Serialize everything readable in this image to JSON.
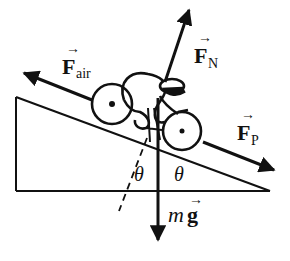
{
  "diagram": {
    "colors": {
      "ink": "#111111",
      "background": "#ffffff"
    },
    "forces": {
      "air": {
        "symbol": "F",
        "subscript": "air",
        "arrow": "→"
      },
      "normal": {
        "symbol": "F",
        "subscript": "N",
        "arrow": "→"
      },
      "push": {
        "symbol": "F",
        "subscript": "P",
        "arrow": "→"
      },
      "gravity": {
        "prefix": "m",
        "symbol": "g",
        "arrow": "→"
      }
    },
    "angles": {
      "left": "θ",
      "right": "θ"
    }
  }
}
